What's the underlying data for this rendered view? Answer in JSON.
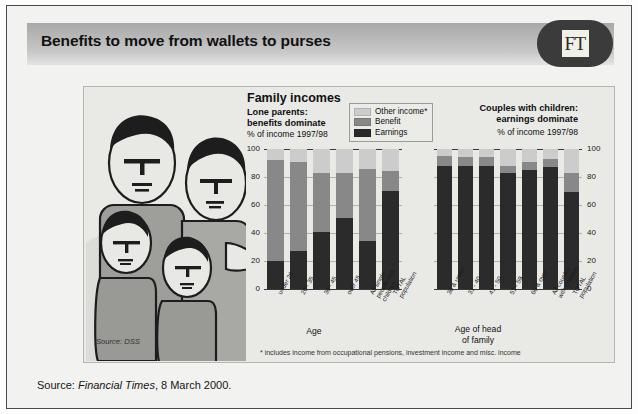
{
  "header": {
    "headline": "Benefits to move from wallets to purses",
    "brand": "FT"
  },
  "chart_titles": {
    "main_title": "Family incomes",
    "left_sub_line1": "Lone parents:",
    "left_sub_line2": "benefits dominate",
    "left_units": "% of income 1997/98",
    "right_sub_line1": "Couples with children:",
    "right_sub_line2": "earnings dominate",
    "right_units": "% of income 1997/98"
  },
  "legend": {
    "items": [
      {
        "label": "Other income*",
        "color": "#cccccc"
      },
      {
        "label": "Benefit",
        "color": "#888888"
      },
      {
        "label": "Earnings",
        "color": "#2b2b2b"
      }
    ]
  },
  "axis_titles": {
    "left": "Age",
    "right_line1": "Age of head",
    "right_line2": "of family"
  },
  "notes": {
    "source_dss": "Source: DSS",
    "footnote": "* includes income from occupational pensions, investment income and misc. income",
    "bottom_source_prefix": "Source: ",
    "bottom_source_italic": "Financial Times",
    "bottom_source_suffix": ", 8 March 2000."
  },
  "chart_data": [
    {
      "id": "lone-parents",
      "type": "bar",
      "stacked": true,
      "title": "Lone parents: benefits dominate",
      "subtitle": "% of income 1997/98",
      "xlabel": "Age",
      "ylabel": "% of income 1997/98",
      "ylim": [
        0,
        100
      ],
      "yticks": [
        0,
        20,
        40,
        60,
        80,
        100
      ],
      "ytick_labels": [
        "0",
        "20",
        "40",
        "60",
        "80",
        "100"
      ],
      "grid": true,
      "legend_position": "top-right",
      "categories": [
        "under 26",
        "26 - 35",
        "36 - 45",
        "over 45",
        "All single\npeople with\nchildren",
        "TOTAL\npopulation"
      ],
      "series": [
        {
          "name": "Earnings",
          "color": "#2b2b2b",
          "values": [
            20,
            27,
            41,
            51,
            34,
            70
          ]
        },
        {
          "name": "Benefit",
          "color": "#888888",
          "values": [
            72,
            64,
            42,
            32,
            52,
            14
          ]
        },
        {
          "name": "Other income*",
          "color": "#cccccc",
          "values": [
            8,
            9,
            17,
            17,
            14,
            16
          ]
        }
      ]
    },
    {
      "id": "couples-with-children",
      "type": "bar",
      "stacked": true,
      "title": "Couples with children: earnings dominate",
      "subtitle": "% of income 1997/98",
      "xlabel": "Age of head of family",
      "ylabel": "% of income 1997/98",
      "ylim": [
        0,
        100
      ],
      "yticks": [
        0,
        20,
        40,
        60,
        80,
        100
      ],
      "ytick_labels": [
        "0",
        "20",
        "40",
        "60",
        "80",
        "100"
      ],
      "grid": true,
      "axis_side": "right",
      "categories": [
        "30 & under",
        "31 - 40",
        "41 - 50",
        "51 - 59",
        "60 & over",
        "All couples\nwith children",
        "TOTAL\npopulation"
      ],
      "series": [
        {
          "name": "Earnings",
          "color": "#2b2b2b",
          "values": [
            88,
            88,
            88,
            83,
            85,
            87,
            69
          ]
        },
        {
          "name": "Benefit",
          "color": "#888888",
          "values": [
            7,
            6,
            6,
            5,
            6,
            6,
            14
          ]
        },
        {
          "name": "Other income*",
          "color": "#cccccc",
          "values": [
            5,
            6,
            6,
            12,
            9,
            7,
            17
          ]
        }
      ]
    }
  ]
}
